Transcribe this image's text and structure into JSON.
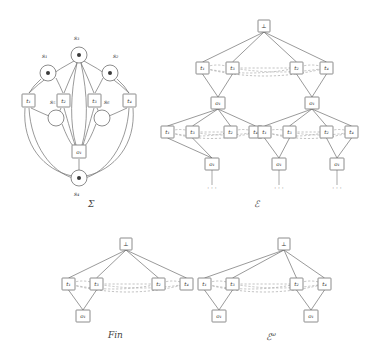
{
  "figure": {
    "type": "petri-net-and-event-structures",
    "captions": {
      "sigma": "Σ",
      "epsilon": "ℰ",
      "fin": "Fin",
      "epsilon_omega_base": "ℰ",
      "epsilon_omega_sup": "ω"
    }
  },
  "sigma": {
    "label": "Σ",
    "places": [
      {
        "id": "s1",
        "label": "s₁",
        "marked": true,
        "cx": 48,
        "cy": 73,
        "r": 8,
        "label_x": 42,
        "label_y": 58
      },
      {
        "id": "s2",
        "label": "s₂",
        "marked": true,
        "cx": 110,
        "cy": 73,
        "r": 8,
        "label_x": 113,
        "label_y": 58
      },
      {
        "id": "s3",
        "label": "s₃",
        "marked": true,
        "cx": 79,
        "cy": 55,
        "r": 8,
        "label_x": 74,
        "label_y": 40
      },
      {
        "id": "s4",
        "label": "s₄",
        "marked": true,
        "cx": 79,
        "cy": 178,
        "r": 8,
        "label_x": 74,
        "label_y": 196
      },
      {
        "id": "s5",
        "label": "s₅",
        "marked": false,
        "cx": 56,
        "cy": 118,
        "r": 8,
        "label_x": 50,
        "label_y": 104
      },
      {
        "id": "s6",
        "label": "s₆",
        "marked": false,
        "cx": 102,
        "cy": 118,
        "r": 8,
        "label_x": 104,
        "label_y": 104
      }
    ],
    "transitions": [
      {
        "id": "t1",
        "label": "t₁",
        "x": 22,
        "y": 94,
        "w": 13,
        "h": 13
      },
      {
        "id": "t2",
        "label": "t₂",
        "x": 57,
        "y": 94,
        "w": 13,
        "h": 13
      },
      {
        "id": "t3",
        "label": "t₃",
        "x": 88,
        "y": 94,
        "w": 13,
        "h": 13
      },
      {
        "id": "t4",
        "label": "t₄",
        "x": 123,
        "y": 94,
        "w": 13,
        "h": 13
      },
      {
        "id": "o1",
        "label": "o₁",
        "x": 72,
        "y": 145,
        "w": 14,
        "h": 13
      }
    ]
  },
  "epsilon": {
    "label": "ℰ",
    "root": {
      "label": "⊥",
      "x": 258,
      "y": 20
    },
    "level1": [
      {
        "label": "t₁",
        "x": 196,
        "y": 62
      },
      {
        "label": "t₃",
        "x": 226,
        "y": 62
      },
      {
        "label": "t₂",
        "x": 290,
        "y": 62
      },
      {
        "label": "t₄",
        "x": 320,
        "y": 62
      }
    ],
    "level2": [
      {
        "label": "o₁",
        "x": 211,
        "y": 97
      },
      {
        "label": "o₁",
        "x": 305,
        "y": 97
      }
    ],
    "level3_left": [
      {
        "label": "t₁",
        "x": 161,
        "y": 126
      },
      {
        "label": "t₃",
        "x": 186,
        "y": 126
      },
      {
        "label": "t₂",
        "x": 224,
        "y": 126
      },
      {
        "label": "t₄",
        "x": 249,
        "y": 126
      }
    ],
    "level3_right": [
      {
        "label": "t₁",
        "x": 258,
        "y": 126
      },
      {
        "label": "t₃",
        "x": 283,
        "y": 126
      },
      {
        "label": "t₂",
        "x": 320,
        "y": 126
      },
      {
        "label": "t₄",
        "x": 345,
        "y": 126
      }
    ],
    "level4": [
      {
        "label": "o₁",
        "x": 205,
        "y": 158
      },
      {
        "label": "o₁",
        "x": 272,
        "y": 158
      },
      {
        "label": "o₁",
        "x": 330,
        "y": 158
      }
    ],
    "ellipses": [
      {
        "label": "· · ·",
        "x": 212,
        "y": 190
      },
      {
        "label": "· · ·",
        "x": 279,
        "y": 190
      },
      {
        "label": "· · ·",
        "x": 337,
        "y": 190
      }
    ]
  },
  "fin": {
    "label": "Fin",
    "root": {
      "label": "⊥",
      "x": 120,
      "y": 238
    },
    "level1": [
      {
        "label": "t₁",
        "x": 62,
        "y": 278
      },
      {
        "label": "t₃",
        "x": 90,
        "y": 278
      },
      {
        "label": "t₂",
        "x": 152,
        "y": 278
      },
      {
        "label": "t₄",
        "x": 180,
        "y": 278
      }
    ],
    "level2": [
      {
        "label": "o₁",
        "x": 76,
        "y": 310
      }
    ]
  },
  "epsilon_omega": {
    "label": "ℰω",
    "root": {
      "label": "⊥",
      "x": 278,
      "y": 238
    },
    "level1": [
      {
        "label": "t₁",
        "x": 198,
        "y": 278
      },
      {
        "label": "t₃",
        "x": 226,
        "y": 278
      },
      {
        "label": "t₂",
        "x": 290,
        "y": 278
      },
      {
        "label": "t₄",
        "x": 318,
        "y": 278
      }
    ],
    "level2": [
      {
        "label": "o₁",
        "x": 212,
        "y": 310
      },
      {
        "label": "o₁",
        "x": 304,
        "y": 310
      }
    ]
  },
  "style": {
    "stroke": "#6e6e6e",
    "dashed_stroke": "#9a9a9a",
    "node_fill": "#ffffff",
    "text": "#3a3a3a"
  }
}
